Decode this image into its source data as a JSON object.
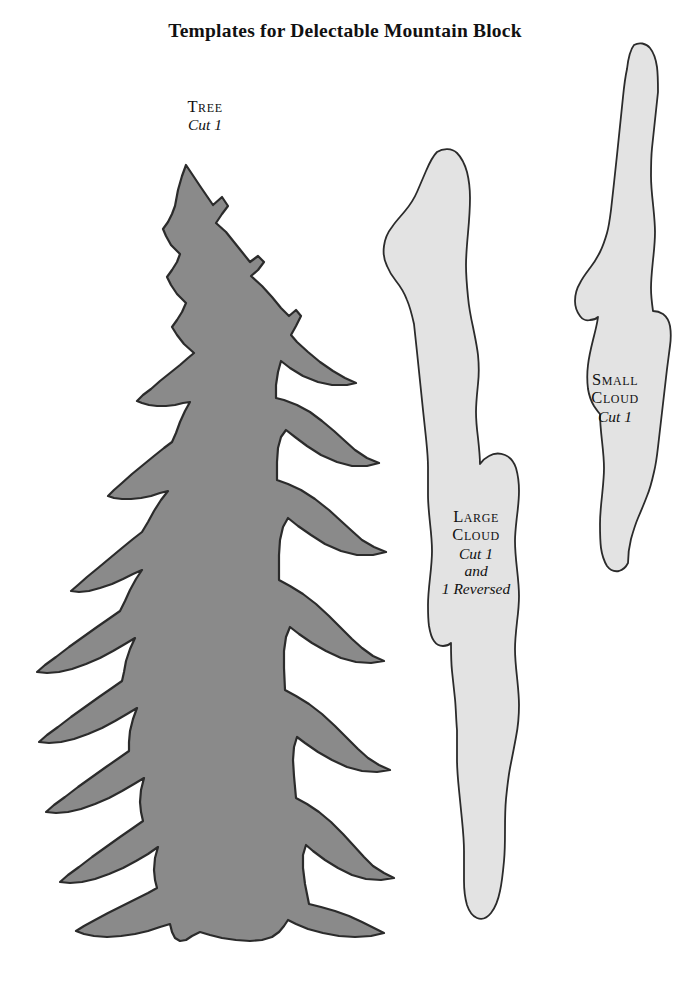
{
  "page": {
    "title": "Templates for Delectable Mountain Block",
    "background_color": "#ffffff",
    "text_color": "#111111"
  },
  "colors": {
    "tree_fill": "#8a8a8a",
    "cloud_fill": "#e3e3e3",
    "outline": "#2b2b2b"
  },
  "templates": [
    {
      "id": "tree",
      "name_label": "Tree",
      "cut_lines": [
        "Cut 1"
      ],
      "fill": "#8a8a8a",
      "icon": "fir-tree-shape"
    },
    {
      "id": "large-cloud",
      "name_label_line1": "Large",
      "name_label_line2": "Cloud",
      "cut_lines": [
        "Cut 1",
        "and",
        "1 Reversed"
      ],
      "fill": "#e3e3e3",
      "icon": "large-cloud-shape"
    },
    {
      "id": "small-cloud",
      "name_label_line1": "Small",
      "name_label_line2": "Cloud",
      "cut_lines": [
        "Cut 1"
      ],
      "fill": "#e3e3e3",
      "icon": "small-cloud-shape"
    }
  ],
  "labels": {
    "tree": {
      "title": "Tree",
      "cut": "Cut 1"
    },
    "large_cloud": {
      "title_line1": "Large",
      "title_line2": "Cloud",
      "cut1": "Cut 1",
      "cut2": "and",
      "cut3": "1 Reversed"
    },
    "small_cloud": {
      "title_line1": "Small",
      "title_line2": "Cloud",
      "cut": "Cut 1"
    }
  }
}
